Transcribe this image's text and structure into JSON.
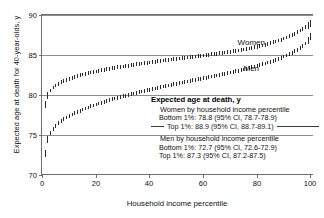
{
  "chart_data": {
    "type": "scatter",
    "title": "",
    "xlabel": "Household income percentile",
    "ylabel": "Expected age at death for 40-year-olds, y",
    "xlim": [
      0,
      101
    ],
    "ylim": [
      70,
      90
    ],
    "xticks": [
      0,
      20,
      40,
      60,
      80,
      100
    ],
    "yticks": [
      70,
      75,
      80,
      85,
      90
    ],
    "grid": true,
    "legend_position": "inline-annotation",
    "marker": "vertical-error-bar",
    "annotations": [
      {
        "text": "Women",
        "x": 78,
        "y": 86.6
      },
      {
        "text": "Men",
        "x": 78,
        "y": 83.4
      }
    ],
    "series": [
      {
        "name": "Women",
        "x": [
          1,
          2,
          3,
          4,
          5,
          6,
          7,
          8,
          9,
          10,
          11,
          12,
          13,
          14,
          15,
          16,
          17,
          18,
          19,
          20,
          21,
          22,
          23,
          24,
          25,
          26,
          27,
          28,
          29,
          30,
          31,
          32,
          33,
          34,
          35,
          36,
          37,
          38,
          39,
          40,
          41,
          42,
          43,
          44,
          45,
          46,
          47,
          48,
          49,
          50,
          51,
          52,
          53,
          54,
          55,
          56,
          57,
          58,
          59,
          60,
          61,
          62,
          63,
          64,
          65,
          66,
          67,
          68,
          69,
          70,
          71,
          72,
          73,
          74,
          75,
          76,
          77,
          78,
          79,
          80,
          81,
          82,
          83,
          84,
          85,
          86,
          87,
          88,
          89,
          90,
          91,
          92,
          93,
          94,
          95,
          96,
          97,
          98,
          99,
          100
        ],
        "values": [
          78.8,
          79.95,
          80.55,
          80.95,
          81.2,
          81.42,
          81.6,
          81.76,
          81.9,
          82.03,
          82.15,
          82.26,
          82.36,
          82.46,
          82.55,
          82.64,
          82.72,
          82.8,
          82.88,
          82.95,
          83.02,
          83.09,
          83.15,
          83.22,
          83.28,
          83.34,
          83.4,
          83.46,
          83.51,
          83.57,
          83.62,
          83.67,
          83.73,
          83.78,
          83.83,
          83.88,
          83.93,
          83.97,
          84.02,
          84.07,
          84.12,
          84.16,
          84.21,
          84.25,
          84.3,
          84.34,
          84.39,
          84.43,
          84.48,
          84.52,
          84.56,
          84.61,
          84.65,
          84.69,
          84.73,
          84.78,
          84.82,
          84.86,
          84.9,
          84.95,
          84.99,
          85.03,
          85.08,
          85.12,
          85.17,
          85.21,
          85.26,
          85.31,
          85.36,
          85.41,
          85.46,
          85.51,
          85.57,
          85.63,
          85.69,
          85.75,
          85.82,
          85.89,
          85.96,
          86.04,
          86.12,
          86.2,
          86.29,
          86.38,
          86.48,
          86.58,
          86.69,
          86.8,
          86.92,
          87.05,
          87.19,
          87.34,
          87.5,
          87.67,
          87.86,
          88.05,
          88.26,
          88.48,
          88.7,
          88.9
        ],
        "ci_low_at_p1": 78.7,
        "ci_high_at_p1": 78.9,
        "ci_low_at_p100": 88.7,
        "ci_high_at_p100": 89.1
      },
      {
        "name": "Men",
        "x": [
          1,
          2,
          3,
          4,
          5,
          6,
          7,
          8,
          9,
          10,
          11,
          12,
          13,
          14,
          15,
          16,
          17,
          18,
          19,
          20,
          21,
          22,
          23,
          24,
          25,
          26,
          27,
          28,
          29,
          30,
          31,
          32,
          33,
          34,
          35,
          36,
          37,
          38,
          39,
          40,
          41,
          42,
          43,
          44,
          45,
          46,
          47,
          48,
          49,
          50,
          51,
          52,
          53,
          54,
          55,
          56,
          57,
          58,
          59,
          60,
          61,
          62,
          63,
          64,
          65,
          66,
          67,
          68,
          69,
          70,
          71,
          72,
          73,
          74,
          75,
          76,
          77,
          78,
          79,
          80,
          81,
          82,
          83,
          84,
          85,
          86,
          87,
          88,
          89,
          90,
          91,
          92,
          93,
          94,
          95,
          96,
          97,
          98,
          99,
          100
        ],
        "values": [
          72.7,
          74.4,
          75.22,
          75.75,
          76.14,
          76.46,
          76.73,
          76.97,
          77.18,
          77.38,
          77.56,
          77.73,
          77.89,
          78.04,
          78.18,
          78.32,
          78.45,
          78.58,
          78.7,
          78.82,
          78.93,
          79.04,
          79.15,
          79.25,
          79.36,
          79.46,
          79.55,
          79.65,
          79.74,
          79.83,
          79.92,
          80.01,
          80.1,
          80.18,
          80.27,
          80.35,
          80.43,
          80.51,
          80.59,
          80.67,
          80.75,
          80.82,
          80.9,
          80.97,
          81.05,
          81.12,
          81.19,
          81.27,
          81.34,
          81.41,
          81.48,
          81.55,
          81.62,
          81.69,
          81.76,
          81.83,
          81.9,
          81.96,
          82.03,
          82.1,
          82.17,
          82.24,
          82.31,
          82.38,
          82.45,
          82.52,
          82.59,
          82.66,
          82.73,
          82.81,
          82.88,
          82.96,
          83.04,
          83.12,
          83.2,
          83.28,
          83.37,
          83.46,
          83.55,
          83.64,
          83.74,
          83.84,
          83.94,
          84.05,
          84.16,
          84.28,
          84.4,
          84.53,
          84.66,
          84.8,
          84.95,
          85.11,
          85.28,
          85.46,
          85.65,
          85.86,
          86.08,
          86.44,
          86.85,
          87.3
        ],
        "ci_low_at_p1": 72.6,
        "ci_high_at_p1": 72.9,
        "ci_low_at_p100": 87.2,
        "ci_high_at_p100": 87.5
      }
    ]
  },
  "annotation": {
    "header": "Expected age at death, y",
    "women_group": "Women by household income percentile",
    "women_bottom": "Bottom 1%: 78.8 (95% CI, 78.7-78.9)",
    "women_top": "Top 1%: 88.9 (95% CI, 88.7-89.1)",
    "men_group": "Men by household income percentile",
    "men_bottom": "Bottom 1%: 72.7 (95% CI, 72.6-72.9)",
    "men_top": "Top 1%: 87.3 (95% CI, 87.2-87.5)"
  },
  "colors": {
    "marker": "#2b2b2b",
    "axis": "#6f6f6f",
    "grid": "#8d8d8d",
    "text": "#111111"
  }
}
